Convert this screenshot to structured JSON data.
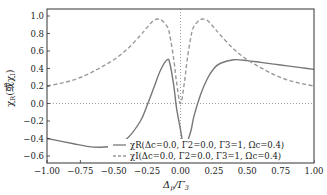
{
  "chart_data": {
    "type": "line",
    "title": "",
    "xlabel": "Δp/Γ3",
    "ylabel": "χR(或χI)",
    "xlim": [
      -1.0,
      1.0
    ],
    "ylim": [
      -0.68,
      1.08
    ],
    "xticks": [
      -1.0,
      -0.75,
      -0.5,
      -0.25,
      0.0,
      0.25,
      0.5,
      0.75,
      1.0
    ],
    "xtick_labels": [
      "−1.00",
      "−0.75",
      "−0.50",
      "−0.25",
      "0.00",
      "0.25",
      "0.50",
      "0.75",
      "1.00"
    ],
    "yticks": [
      -0.6,
      -0.4,
      -0.2,
      0.0,
      0.2,
      0.4,
      0.6,
      0.8,
      1.0
    ],
    "ytick_labels": [
      "−0.6",
      "−0.4",
      "−0.2",
      "0.0",
      "0.2",
      "0.4",
      "0.6",
      "0.8",
      "1.0"
    ],
    "grid": false,
    "reference_lines": [
      {
        "orientation": "horizontal",
        "value": 0.0,
        "style": "dotted"
      },
      {
        "orientation": "vertical",
        "value": 0.0,
        "style": "dotted"
      }
    ],
    "legend_position": "lower right",
    "x": [
      -1.0,
      -0.9,
      -0.8,
      -0.7,
      -0.6,
      -0.5,
      -0.4,
      -0.3,
      -0.25,
      -0.2,
      -0.15,
      -0.1,
      -0.08,
      -0.05,
      -0.03,
      0.0,
      0.03,
      0.05,
      0.08,
      0.1,
      0.15,
      0.2,
      0.25,
      0.3,
      0.4,
      0.5,
      0.6,
      0.7,
      0.8,
      0.9,
      1.0
    ],
    "series": [
      {
        "name": "χR(Δc=0.0, Γ2=0.0, Γ3=1, Ωc=0.4)",
        "style": "solid",
        "color": "#777777",
        "values": [
          -0.4,
          -0.43,
          -0.46,
          -0.49,
          -0.5,
          -0.48,
          -0.4,
          -0.2,
          -0.02,
          0.18,
          0.38,
          0.5,
          0.46,
          0.2,
          -0.05,
          -0.3,
          -0.55,
          -0.45,
          -0.3,
          -0.15,
          0.1,
          0.28,
          0.4,
          0.46,
          0.5,
          0.49,
          0.47,
          0.45,
          0.43,
          0.41,
          0.39
        ]
      },
      {
        "name": "χI(Δc=0.0, Γ2=0.0, Γ3=1, Ωc=0.4)",
        "style": "dashed",
        "color": "#999999",
        "values": [
          0.2,
          0.23,
          0.27,
          0.33,
          0.41,
          0.5,
          0.62,
          0.78,
          0.87,
          0.95,
          0.96,
          0.88,
          0.78,
          0.5,
          0.25,
          0.0,
          0.25,
          0.5,
          0.78,
          0.88,
          0.96,
          0.95,
          0.87,
          0.78,
          0.62,
          0.5,
          0.41,
          0.33,
          0.27,
          0.23,
          0.2
        ]
      }
    ]
  },
  "legend": {
    "items": [
      {
        "symbol": "χR",
        "params": "(Δc=0.0, Γ2=0.0, Γ3=1, Ωc=0.4)"
      },
      {
        "symbol": "χI",
        "params": "(Δc=0.0, Γ2=0.0, Γ3=1, Ωc=0.4)"
      }
    ]
  },
  "axes": {
    "xlabel_main": "Δ",
    "xlabel_sub": "p",
    "xlabel_rest": "/Γ",
    "xlabel_sub2": "3",
    "ylabel_main": "χ",
    "ylabel_sub": "R",
    "ylabel_rest": "(或χ",
    "ylabel_sub2": "I",
    "ylabel_end": ")"
  }
}
